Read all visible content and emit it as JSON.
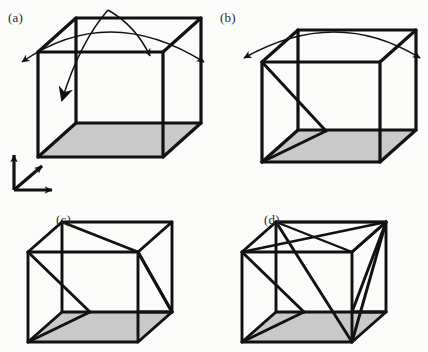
{
  "figure": {
    "background_color": "#fbfbf9",
    "ink_color": "#111111",
    "shaded_face_color": "#c9c9c9",
    "width": 428,
    "height": 352
  },
  "panels": [
    {
      "id": "a",
      "label": "(a)",
      "label_x": 8,
      "label_y": 10,
      "cube": {
        "origin_x": 38,
        "origin_y": 52,
        "width": 125,
        "height": 105,
        "depth_x": 38,
        "depth_y": -34,
        "edge_width": 3.2,
        "shaded_face": "bottom"
      },
      "diagonals": [],
      "arcs": [
        {
          "name": "wide-double-arc",
          "path": "M 18 62 Q 108 2 208 62",
          "arrow_start": true,
          "arrow_end": true
        },
        {
          "name": "middle-arc",
          "path": "M 108 10 Q 135 28 152 58",
          "arrow_start": false,
          "arrow_end": true
        },
        {
          "name": "steep-inward-arc",
          "path": "M 108 10 Q 82 44 62 104",
          "arrow_start": false,
          "arrow_end": true
        }
      ],
      "axes": {
        "name": "coordinate-triad",
        "origin_x": 14,
        "origin_y": 190,
        "vertical_len": 38,
        "horizontal_len": 38,
        "diagonal_dx": 26,
        "diagonal_dy": -22
      }
    },
    {
      "id": "b",
      "label": "(b)",
      "label_x": 220,
      "label_y": 10,
      "cube": {
        "origin_x": 262,
        "origin_y": 62,
        "width": 118,
        "height": 100,
        "depth_x": 36,
        "depth_y": -32,
        "edge_width": 3.2,
        "shaded_face": "bottom"
      },
      "diagonals": [
        {
          "name": "left-face-diagonal",
          "from": "back-top-left",
          "to": "front-bottom-left"
        }
      ],
      "arcs": [
        {
          "name": "wide-double-arc",
          "path": "M 246 58 Q 336 8 418 58",
          "arrow_start": true,
          "arrow_end": true
        }
      ],
      "axes": null
    },
    {
      "id": "c",
      "label": "(c)",
      "label_x": 56,
      "label_y": 212,
      "cube": {
        "origin_x": 58,
        "origin_y": 240,
        "width": 110,
        "height": 90,
        "depth_x": 34,
        "depth_y": -30,
        "edge_width": 3.0,
        "shaded_face": "bottom"
      },
      "diagonals": [
        {
          "name": "left-face-diagonal",
          "from": "back-top-left",
          "to": "front-bottom-left"
        },
        {
          "name": "top-face-diagonal",
          "from": "back-top-left",
          "to": "front-top-right"
        },
        {
          "name": "right-face-diagonal",
          "from": "front-top-right",
          "to": "back-bottom-right"
        }
      ],
      "arcs": [],
      "axes": null
    },
    {
      "id": "d",
      "label": "(d)",
      "label_x": 264,
      "label_y": 212,
      "cube": {
        "origin_x": 268,
        "origin_y": 240,
        "width": 110,
        "height": 90,
        "depth_x": 34,
        "depth_y": -30,
        "edge_width": 3.0,
        "shaded_face": "bottom"
      },
      "diagonals": [
        {
          "name": "left-face-diagonal",
          "from": "back-top-left",
          "to": "front-bottom-left"
        },
        {
          "name": "top-face-diagonal-1",
          "from": "back-top-left",
          "to": "front-top-right"
        },
        {
          "name": "top-face-diagonal-2",
          "from": "front-top-left",
          "to": "back-top-right"
        },
        {
          "name": "right-face-diagonal",
          "from": "front-top-right",
          "to": "back-bottom-right"
        },
        {
          "name": "front-face-diagonal",
          "from": "front-top-right",
          "to": "front-bottom-left"
        },
        {
          "name": "space-diagonal",
          "from": "back-top-right",
          "to": "front-bottom-right"
        },
        {
          "name": "bottom-left-diagonal",
          "from": "front-bottom-left",
          "to": "back-bottom-left"
        }
      ],
      "arcs": [],
      "axes": null
    }
  ]
}
